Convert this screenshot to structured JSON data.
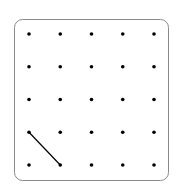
{
  "geoboard": {
    "rows": 5,
    "cols": 5,
    "dot_color": "#000000",
    "border_color": "#8a8a8a",
    "segments": [
      {
        "from": {
          "row": 3,
          "col": 0
        },
        "to": {
          "row": 4,
          "col": 1
        }
      }
    ]
  }
}
